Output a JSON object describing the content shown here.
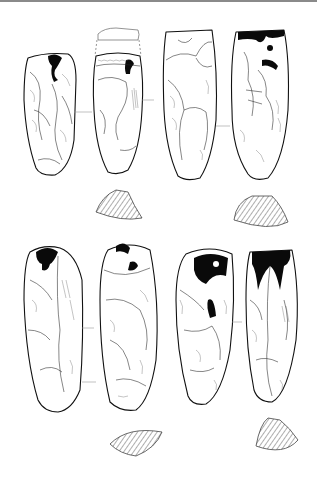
{
  "plate": {
    "subject": "flint axe blade illustrations",
    "rows": [
      {
        "artifacts": [
          {
            "id": "axe-1",
            "view": "face",
            "has_cortex": true
          },
          {
            "id": "axe-2",
            "view": "face",
            "has_cortex": true,
            "reconstructed_butt": true
          },
          {
            "id": "axe-3",
            "view": "face",
            "has_cortex": false
          },
          {
            "id": "axe-4",
            "view": "face",
            "has_cortex": true
          }
        ],
        "sections": [
          {
            "id": "section-1",
            "pattern": "diagonal-hatch"
          },
          {
            "id": "section-2",
            "pattern": "diagonal-hatch"
          }
        ]
      },
      {
        "artifacts": [
          {
            "id": "axe-5",
            "view": "face",
            "has_cortex": true
          },
          {
            "id": "axe-6",
            "view": "face",
            "has_cortex": true
          },
          {
            "id": "axe-7",
            "view": "face",
            "has_cortex": true
          },
          {
            "id": "axe-8",
            "view": "face",
            "has_cortex": true
          }
        ],
        "sections": [
          {
            "id": "section-3",
            "pattern": "diagonal-hatch"
          },
          {
            "id": "section-4",
            "pattern": "diagonal-hatch"
          }
        ]
      }
    ]
  },
  "colors": {
    "ink": "#111111",
    "paper": "#ffffff",
    "rule": "#8a8a8a"
  }
}
